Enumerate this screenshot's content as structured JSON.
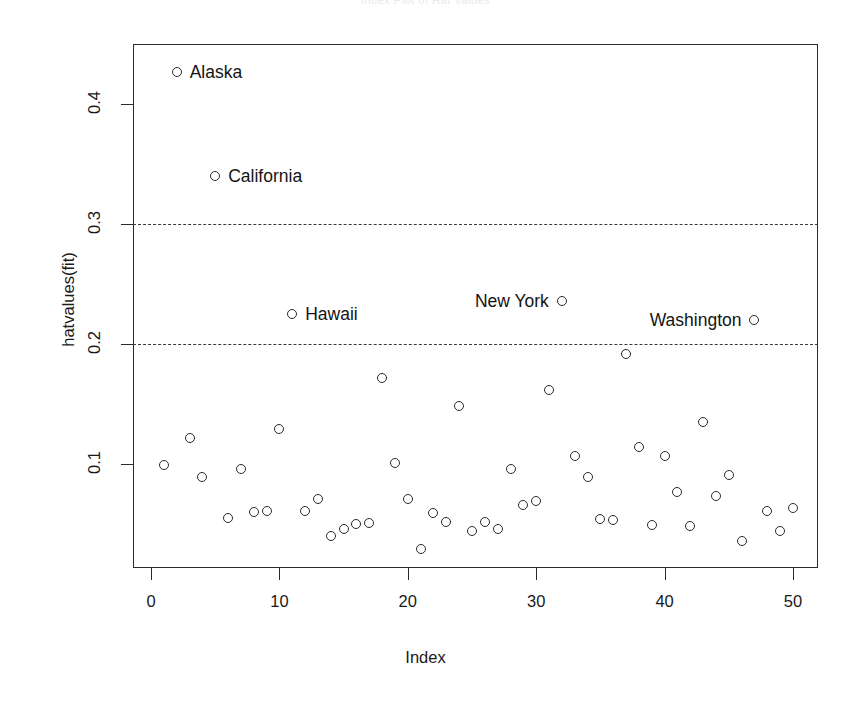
{
  "chart_data": {
    "type": "scatter",
    "title": "Index Plot of Hat Values",
    "xlabel": "Index",
    "ylabel": "hatvalues(fit)",
    "xlim": [
      0,
      51
    ],
    "ylim": [
      0.0,
      0.45
    ],
    "xticks": [
      0,
      10,
      20,
      30,
      40,
      50
    ],
    "xtick_labels": [
      "0",
      "10",
      "20",
      "30",
      "40",
      "50"
    ],
    "yticks": [
      0.1,
      0.2,
      0.3,
      0.4
    ],
    "ytick_labels": [
      "0.1",
      "0.2",
      "0.3",
      "0.4"
    ],
    "grid": false,
    "legend": null,
    "marker": "open-circle",
    "reference_lines": [
      {
        "name": "two-times-average-leverage",
        "y": 0.2,
        "style": "dashed"
      },
      {
        "name": "three-times-average-leverage",
        "y": 0.3,
        "style": "dashed"
      }
    ],
    "x": [
      1,
      2,
      3,
      4,
      5,
      6,
      7,
      8,
      9,
      10,
      11,
      12,
      13,
      14,
      15,
      16,
      17,
      18,
      19,
      20,
      21,
      22,
      23,
      24,
      25,
      26,
      27,
      28,
      29,
      30,
      31,
      32,
      33,
      34,
      35,
      36,
      37,
      38,
      39,
      40,
      41,
      42,
      43,
      44,
      45,
      46,
      47,
      48,
      49,
      50
    ],
    "values": [
      0.099,
      0.427,
      0.122,
      0.089,
      0.34,
      0.055,
      0.096,
      0.06,
      0.061,
      0.129,
      0.225,
      0.061,
      0.071,
      0.04,
      0.046,
      0.05,
      0.051,
      0.172,
      0.101,
      0.071,
      0.029,
      0.059,
      0.052,
      0.148,
      0.044,
      0.052,
      0.046,
      0.096,
      0.066,
      0.069,
      0.162,
      0.236,
      0.107,
      0.089,
      0.054,
      0.053,
      0.192,
      0.114,
      0.049,
      0.107,
      0.077,
      0.048,
      0.135,
      0.073,
      0.091,
      0.036,
      0.22,
      0.061,
      0.044,
      0.063
    ],
    "labeled_points": [
      {
        "name": "Alaska",
        "x": 2,
        "y": 0.427,
        "label_side": "right"
      },
      {
        "name": "California",
        "x": 5,
        "y": 0.34,
        "label_side": "right"
      },
      {
        "name": "Hawaii",
        "x": 11,
        "y": 0.225,
        "label_side": "right"
      },
      {
        "name": "New York",
        "x": 32,
        "y": 0.236,
        "label_side": "left"
      },
      {
        "name": "Washington",
        "x": 47,
        "y": 0.22,
        "label_side": "left"
      }
    ]
  }
}
